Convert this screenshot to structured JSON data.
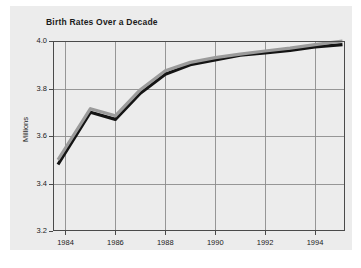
{
  "chart_data": {
    "type": "line",
    "title": "Birth Rates Over a Decade",
    "xlabel": "",
    "ylabel": "Millions",
    "xlim": [
      1983.5,
      1995.2
    ],
    "ylim": [
      3.2,
      4.0
    ],
    "grid": true,
    "legend": "none",
    "xticks": [
      "1984",
      "1986",
      "1988",
      "1990",
      "1992",
      "1994"
    ],
    "xtick_values": [
      1984,
      1986,
      1988,
      1990,
      1992,
      1994
    ],
    "yticks": [
      "3.2",
      "3.4",
      "3.6",
      "3.8",
      "4.0"
    ],
    "ytick_values": [
      3.2,
      3.4,
      3.6,
      3.8,
      4.0
    ],
    "x": [
      1983.7,
      1985.0,
      1986.0,
      1987.0,
      1988.0,
      1989.0,
      1990.0,
      1991.0,
      1992.0,
      1993.0,
      1994.0,
      1995.1
    ],
    "series": [
      {
        "name": "birth-rate-black",
        "color": "#141414",
        "values": [
          3.48,
          3.7,
          3.67,
          3.78,
          3.86,
          3.9,
          3.92,
          3.94,
          3.95,
          3.96,
          3.975,
          3.985
        ]
      },
      {
        "name": "birth-rate-gray",
        "color": "#9b9b9b",
        "values": [
          3.5,
          3.715,
          3.685,
          3.795,
          3.875,
          3.91,
          3.93,
          3.945,
          3.958,
          3.97,
          3.985,
          4.0
        ]
      }
    ],
    "colors": {
      "card_background": "#ececec",
      "page_background": "#ffffff",
      "axis": "#4a4a4a",
      "grid": "#8c8c8c",
      "text": "#1b1b1b",
      "series_black": "#141414",
      "series_gray": "#9b9b9b"
    },
    "plot_box": {
      "left": 53,
      "top": 41,
      "right": 345,
      "bottom": 231
    }
  }
}
